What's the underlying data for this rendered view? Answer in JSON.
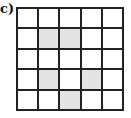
{
  "label": "c)",
  "grid": {
    "rows": 5,
    "cols": 5,
    "shaded_color": "#e4e4e4",
    "shaded_cells": [
      [
        1,
        1
      ],
      [
        1,
        2
      ],
      [
        3,
        1
      ],
      [
        3,
        3
      ],
      [
        4,
        2
      ]
    ]
  }
}
